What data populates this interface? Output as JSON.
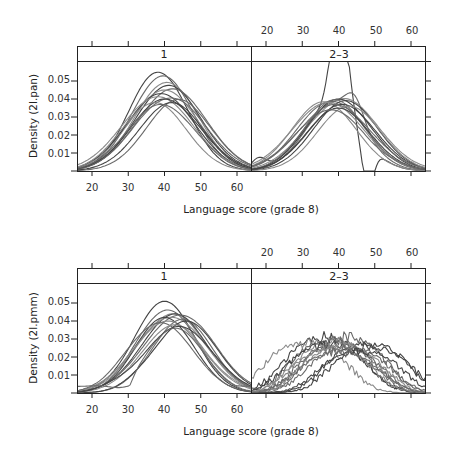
{
  "chart_data": [
    {
      "type": "line",
      "title": "",
      "xlabel": "Language score (grade 8)",
      "ylabel": "Density (2l.pan)",
      "xlim": [
        16,
        64
      ],
      "ylim": [
        0,
        0.059
      ],
      "x_ticks": [
        20,
        30,
        40,
        50,
        60
      ],
      "y_ticks": [
        0.01,
        0.02,
        0.03,
        0.04,
        0.05
      ],
      "y_tick_labels": [
        "0.01",
        "0.02",
        "0.03",
        "0.04",
        "0.05"
      ],
      "panels": [
        {
          "strip": "1",
          "series_note": "~14 kernel density curves (imputations), peaks near 38-42",
          "curves": [
            {
              "peak_x": 38.5,
              "peak_y": 0.054
            },
            {
              "peak_x": 39.5,
              "peak_y": 0.052
            },
            {
              "peak_x": 40.5,
              "peak_y": 0.049
            },
            {
              "peak_x": 41,
              "peak_y": 0.047
            },
            {
              "peak_x": 42,
              "peak_y": 0.046
            },
            {
              "peak_x": 40,
              "peak_y": 0.045
            },
            {
              "peak_x": 39,
              "peak_y": 0.043
            },
            {
              "peak_x": 41.5,
              "peak_y": 0.042
            },
            {
              "peak_x": 38,
              "peak_y": 0.041
            },
            {
              "peak_x": 40,
              "peak_y": 0.04
            },
            {
              "peak_x": 44,
              "peak_y": 0.04
            },
            {
              "peak_x": 37,
              "peak_y": 0.039
            },
            {
              "peak_x": 42,
              "peak_y": 0.038
            },
            {
              "peak_x": 39,
              "peak_y": 0.037
            }
          ]
        },
        {
          "strip": "2–3",
          "series_note": "~14 density curves, one spiky curve peaking off-scale near x=40, dip near x=48",
          "curves": [
            {
              "peak_x": 40,
              "peak_y": 0.07
            },
            {
              "peak_x": 44,
              "peak_y": 0.046
            },
            {
              "peak_x": 41,
              "peak_y": 0.041
            },
            {
              "peak_x": 40,
              "peak_y": 0.04
            },
            {
              "peak_x": 38,
              "peak_y": 0.04
            },
            {
              "peak_x": 36,
              "peak_y": 0.039
            },
            {
              "peak_x": 42,
              "peak_y": 0.039
            },
            {
              "peak_x": 39,
              "peak_y": 0.038
            },
            {
              "peak_x": 37,
              "peak_y": 0.038
            },
            {
              "peak_x": 41,
              "peak_y": 0.037
            },
            {
              "peak_x": 39,
              "peak_y": 0.037
            },
            {
              "peak_x": 43,
              "peak_y": 0.036
            },
            {
              "peak_x": 40,
              "peak_y": 0.035
            },
            {
              "peak_x": 38,
              "peak_y": 0.034
            }
          ]
        }
      ]
    },
    {
      "type": "line",
      "title": "",
      "xlabel": "Language score (grade 8)",
      "ylabel": "Density (2l.pmm)",
      "xlim": [
        16,
        64
      ],
      "ylim": [
        0,
        0.059
      ],
      "x_ticks": [
        20,
        30,
        40,
        50,
        60
      ],
      "y_ticks": [
        0.01,
        0.02,
        0.03,
        0.04,
        0.05
      ],
      "y_tick_labels": [
        "0.01",
        "0.02",
        "0.03",
        "0.04",
        "0.05"
      ],
      "panels": [
        {
          "strip": "1",
          "series_note": "~14 density curves, peaks near 40-45, one curve dips near x=28",
          "curves": [
            {
              "peak_x": 40,
              "peak_y": 0.051
            },
            {
              "peak_x": 41,
              "peak_y": 0.046
            },
            {
              "peak_x": 42,
              "peak_y": 0.045
            },
            {
              "peak_x": 43,
              "peak_y": 0.044
            },
            {
              "peak_x": 44,
              "peak_y": 0.043
            },
            {
              "peak_x": 42,
              "peak_y": 0.042
            },
            {
              "peak_x": 40,
              "peak_y": 0.042
            },
            {
              "peak_x": 45,
              "peak_y": 0.041
            },
            {
              "peak_x": 41,
              "peak_y": 0.04
            },
            {
              "peak_x": 46,
              "peak_y": 0.04
            },
            {
              "peak_x": 39,
              "peak_y": 0.039
            },
            {
              "peak_x": 43,
              "peak_y": 0.038
            },
            {
              "peak_x": 44,
              "peak_y": 0.037
            },
            {
              "peak_x": 42,
              "peak_y": 0.036
            }
          ]
        },
        {
          "strip": "2–3",
          "series_note": "~14 broad bimodal-ish density curves, peaks 0.03-0.042 between x=30 and x=50",
          "curves": [
            {
              "peak_x": 35,
              "peak_y": 0.042
            },
            {
              "peak_x": 41,
              "peak_y": 0.042
            },
            {
              "peak_x": 30,
              "peak_y": 0.039
            },
            {
              "peak_x": 47,
              "peak_y": 0.038
            },
            {
              "peak_x": 37,
              "peak_y": 0.04
            },
            {
              "peak_x": 38,
              "peak_y": 0.039
            },
            {
              "peak_x": 36,
              "peak_y": 0.037
            },
            {
              "peak_x": 39,
              "peak_y": 0.036
            },
            {
              "peak_x": 40,
              "peak_y": 0.035
            },
            {
              "peak_x": 48,
              "peak_y": 0.034
            },
            {
              "peak_x": 42,
              "peak_y": 0.034
            },
            {
              "peak_x": 37,
              "peak_y": 0.033
            },
            {
              "peak_x": 45,
              "peak_y": 0.032
            },
            {
              "peak_x": 39,
              "peak_y": 0.031
            }
          ]
        }
      ]
    }
  ],
  "figures": [
    {
      "ylabel": "Density (2l.pan)",
      "xlabel": "Language score (grade 8)",
      "strips": [
        "1",
        "2–3"
      ],
      "x_tick_labels": [
        "20",
        "30",
        "40",
        "50",
        "60"
      ],
      "y_tick_labels": [
        "0.01",
        "0.02",
        "0.03",
        "0.04",
        "0.05"
      ]
    },
    {
      "ylabel": "Density (2l.pmm)",
      "xlabel": "Language score (grade 8)",
      "strips": [
        "1",
        "2–3"
      ],
      "x_tick_labels": [
        "20",
        "30",
        "40",
        "50",
        "60"
      ],
      "y_tick_labels": [
        "0.01",
        "0.02",
        "0.03",
        "0.04",
        "0.05"
      ]
    }
  ],
  "colors": {
    "frame": "#222222",
    "curve_dark": "#444444",
    "curve_mid": "#6a6a6a",
    "curve_light": "#8a8a8a"
  }
}
